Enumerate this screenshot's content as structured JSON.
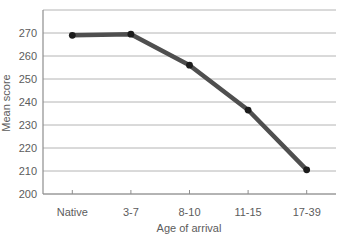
{
  "chart_data": {
    "type": "line",
    "title": "",
    "xlabel": "Age of arrival",
    "ylabel": "Mean score",
    "categories": [
      "Native",
      "3-7",
      "8-10",
      "11-15",
      "17-39"
    ],
    "values": [
      269,
      269.5,
      256,
      236.5,
      210.5
    ],
    "series": [
      {
        "name": "Mean score by age of arrival",
        "values": [
          269,
          269.5,
          256,
          236.5,
          210.5
        ]
      }
    ],
    "yticks": [
      200,
      210,
      220,
      230,
      240,
      250,
      260,
      270
    ],
    "ylim": [
      200,
      280
    ],
    "grid": true,
    "legend_position": "none",
    "colors": {
      "line": "#4f4f4f",
      "marker": "#1c1c1c",
      "grid": "#b4b4b4",
      "axis": "#8e8e8e",
      "text": "#5c5c5c",
      "background": "#ffffff"
    }
  }
}
